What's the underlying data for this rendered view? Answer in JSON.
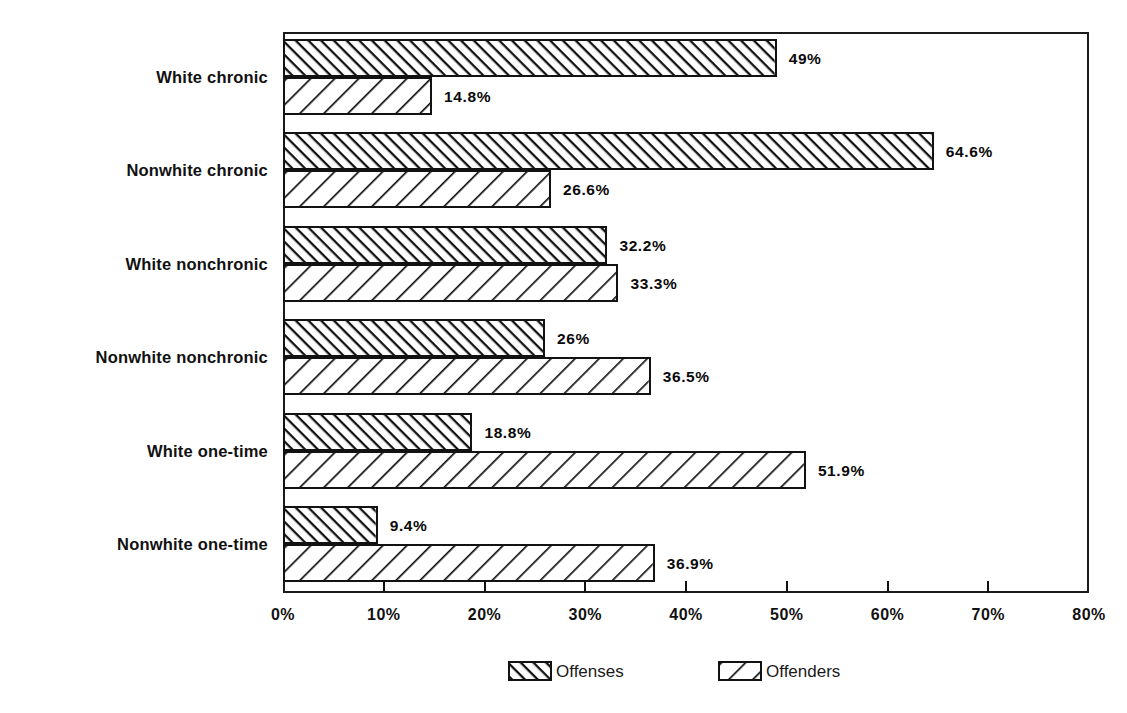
{
  "chart_data": {
    "type": "bar",
    "orientation": "horizontal",
    "title": "",
    "subtitle": "",
    "xlabel": "",
    "ylabel": "",
    "xlim": [
      0,
      80
    ],
    "grid": false,
    "legend_position": "bottom",
    "categories": [
      "White chronic",
      "Nonwhite chronic",
      "White nonchronic",
      "Nonwhite nonchronic",
      "White one-time",
      "Nonwhite one-time"
    ],
    "x_tick_labels": [
      "0%",
      "10%",
      "20%",
      "30%",
      "40%",
      "50%",
      "60%",
      "70%",
      "80%"
    ],
    "x_tick_values": [
      0,
      10,
      20,
      30,
      40,
      50,
      60,
      70,
      80
    ],
    "series": [
      {
        "name": "Offenses",
        "pattern": "dense-backslash-hatch",
        "values": [
          49,
          64.6,
          32.2,
          26,
          18.8,
          9.4
        ],
        "data_labels": [
          "49%",
          "64.6%",
          "32.2%",
          "26%",
          "18.8%",
          "9.4%"
        ]
      },
      {
        "name": "Offenders",
        "pattern": "sparse-forwardslash-hatch",
        "values": [
          14.8,
          26.6,
          33.3,
          36.5,
          51.9,
          36.9
        ],
        "data_labels": [
          "14.8%",
          "26.6%",
          "33.3%",
          "36.5%",
          "51.9%",
          "36.9%"
        ]
      }
    ]
  },
  "legend": {
    "items": [
      {
        "label": "Offenses"
      },
      {
        "label": "Offenders"
      }
    ]
  },
  "colors": {
    "ink": "#111111",
    "background": "#ffffff",
    "frame": "#1a1a1a"
  }
}
